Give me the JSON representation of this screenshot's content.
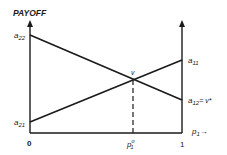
{
  "diagram": {
    "y_axis_label": "PAYOFF",
    "x_axis_label": "p",
    "x_axis_label_sub": "1",
    "x_axis_arrow": "→",
    "origin_label": "0",
    "x_end_label": "1",
    "equilibrium_x_label": "p",
    "equilibrium_x_sub": "1",
    "equilibrium_x_sup": "o",
    "intersection_label": "v",
    "left_labels": {
      "a22": {
        "base": "a",
        "sub": "22"
      },
      "a21": {
        "base": "a",
        "sub": "21"
      }
    },
    "right_labels": {
      "a11": {
        "base": "a",
        "sub": "11"
      },
      "a12": {
        "base": "a",
        "sub": "12",
        "suffix": "= v*"
      }
    },
    "colors": {
      "line": "#1a1a1a",
      "background": "#ffffff"
    }
  }
}
